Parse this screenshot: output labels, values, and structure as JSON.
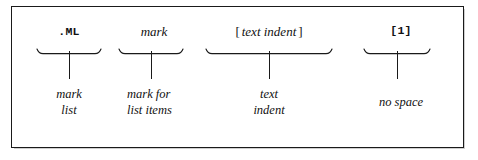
{
  "figure": {
    "type": "syntax-callout-diagram",
    "groups": [
      {
        "id": "mark-list",
        "label": ".ML",
        "label_style": "mono",
        "caption_lines": [
          "mark",
          "list"
        ]
      },
      {
        "id": "mark",
        "label": "mark",
        "label_style": "italic",
        "caption_lines": [
          "mark for",
          "list items"
        ]
      },
      {
        "id": "text-indent",
        "label_open": "[",
        "label": "text indent",
        "label_close": "]",
        "label_style": "italic-bracketed",
        "caption_lines": [
          "text",
          "indent"
        ]
      },
      {
        "id": "no-space",
        "label": "[1]",
        "label_style": "mono",
        "caption_lines": [
          "no space"
        ]
      }
    ]
  },
  "colors": {
    "ink": "#1a1a1a",
    "page": "#ffffff",
    "shadow": "#cfcfcf"
  }
}
